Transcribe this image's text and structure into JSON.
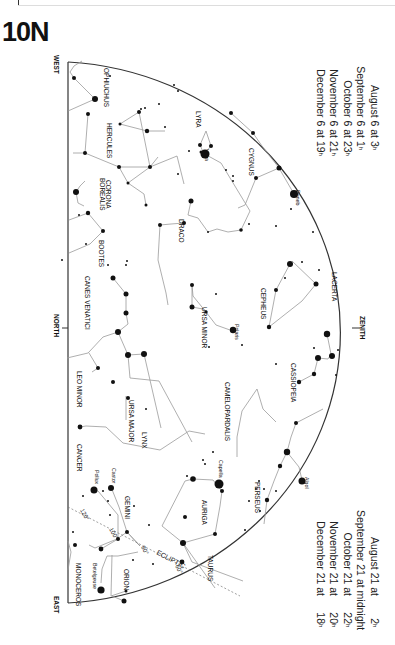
{
  "title": "10N",
  "directions": {
    "west": "WEST",
    "north": "NORTH",
    "east": "EAST",
    "zenith": "ZENITH"
  },
  "times_top": [
    {
      "label": "August 6 at",
      "hour": "3",
      "unit": "h"
    },
    {
      "label": "September 6 at",
      "hour": "1",
      "unit": "h"
    },
    {
      "label": "October 6 at",
      "hour": "23",
      "unit": "h"
    },
    {
      "label": "November 6 at",
      "hour": "21",
      "unit": "h"
    },
    {
      "label": "December 6 at",
      "hour": "19",
      "unit": "h"
    }
  ],
  "times_bottom": [
    {
      "label": "August 21 at",
      "hour": "2",
      "unit": "h"
    },
    {
      "label": "September 21 at midnight",
      "hour": "",
      "unit": ""
    },
    {
      "label": "October 21 at",
      "hour": "22",
      "unit": "h"
    },
    {
      "label": "November 21 at",
      "hour": "20",
      "unit": "h"
    },
    {
      "label": "December 21 at",
      "hour": "18",
      "unit": "h"
    }
  ],
  "constellations": {
    "ophiuchus": "OPHIUCHUS",
    "hercules": "HERCULES",
    "corona_borealis_1": "CORONA",
    "corona_borealis_2": "BOREALIS",
    "bootes": "BOOTES",
    "canes_venatici": "CANES VENATICI",
    "lyra": "LYRA",
    "cygnus": "CYGNUS",
    "draco": "DRACO",
    "ursa_minor": "URSA MINOR",
    "cepheus": "CEPHEUS",
    "lacerta": "LACERTA",
    "cassiopeia": "CASSIOPEIA",
    "camelopardalis": "CAMELOPARDALIS",
    "ursa_major": "URSA MAJOR",
    "leo_minor": "LEO MINOR",
    "lynx": "LYNX",
    "cancer": "CANCER",
    "gemini": "GEMINI",
    "auriga": "AURIGA",
    "perseus": "PERSEUS",
    "taurus": "TAURUS",
    "orion": "ORION",
    "monoceros": "MONOCEROS"
  },
  "stars": {
    "vega": "Vega",
    "deneb": "Deneb",
    "polaris": "Polaris",
    "capella": "Capella",
    "algol": "Algol",
    "castor": "Castor",
    "pollux": "Pollux",
    "betelgeuse": "Betelgeuse"
  },
  "ecliptic": {
    "label": "ECLIPTIC",
    "degrees": [
      "120°",
      "100°",
      "80°",
      "60°"
    ]
  },
  "colors": {
    "ink": "#111111",
    "line": "#9a9a9a",
    "horizon": "#333333"
  }
}
